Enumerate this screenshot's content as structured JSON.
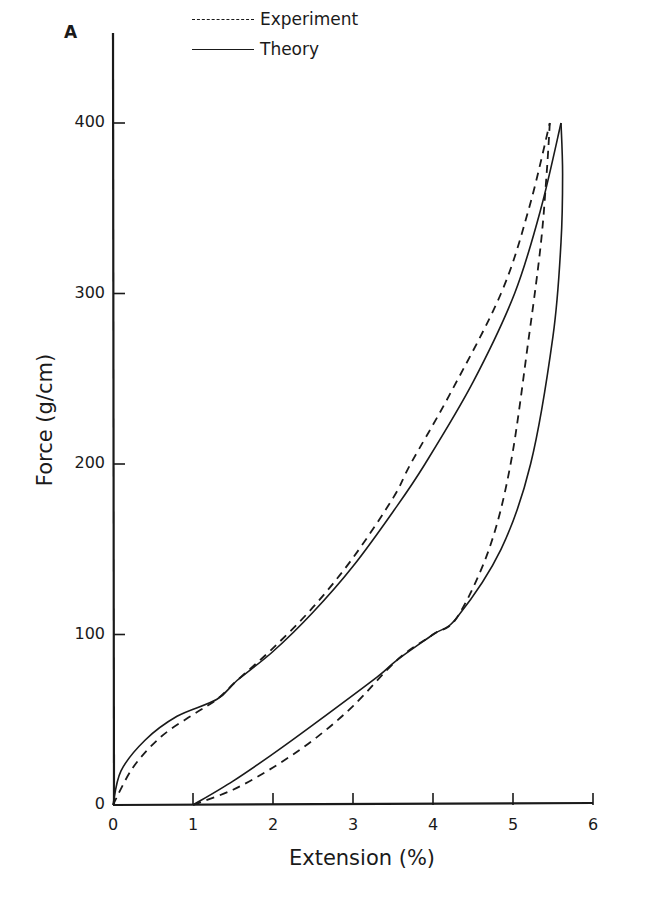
{
  "panel_label": "A",
  "legend": {
    "experiment": "Experiment",
    "theory": "Theory"
  },
  "axes": {
    "xlabel": "Extension (%)",
    "ylabel": "Force (g/cm)",
    "x_ticks": [
      "0",
      "1",
      "2",
      "3",
      "4",
      "5",
      "6"
    ],
    "y_ticks": [
      "0",
      "100",
      "200",
      "300",
      "400"
    ]
  },
  "chart_data": {
    "type": "line",
    "title": "",
    "panel": "A",
    "xlabel": "Extension (%)",
    "ylabel": "Force (g/cm)",
    "xlim": [
      0,
      6
    ],
    "ylim": [
      0,
      450
    ],
    "x_ticks": [
      0,
      1,
      2,
      3,
      4,
      5,
      6
    ],
    "y_ticks": [
      0,
      100,
      200,
      300,
      400
    ],
    "grid": false,
    "legend_position": "top-center",
    "series": [
      {
        "name": "Experiment (loading)",
        "style": "dashed",
        "x": [
          0,
          0.25,
          0.6,
          1.0,
          1.3,
          1.55,
          2.0,
          2.5,
          3.0,
          3.5,
          3.72,
          4.2,
          4.85,
          5.2,
          5.46
        ],
        "y": [
          0,
          22,
          40,
          53,
          62,
          73,
          92,
          116,
          145,
          180,
          200,
          240,
          300,
          350,
          400
        ]
      },
      {
        "name": "Experiment (unloading)",
        "style": "dashed",
        "x": [
          5.46,
          5.42,
          5.35,
          5.2,
          4.97,
          4.7,
          4.3,
          4.0,
          3.55,
          3.0,
          2.5,
          2.0,
          1.5,
          1.0
        ],
        "y": [
          400,
          370,
          330,
          275,
          200,
          150,
          110,
          100,
          85,
          58,
          38,
          22,
          9,
          0
        ]
      },
      {
        "name": "Theory (loading)",
        "style": "solid",
        "x": [
          0,
          0.1,
          0.4,
          0.8,
          1.3,
          1.55,
          2.0,
          2.5,
          3.0,
          3.5,
          3.9,
          4.5,
          5.02,
          5.35,
          5.6
        ],
        "y": [
          0,
          20,
          38,
          52,
          62,
          73,
          90,
          113,
          140,
          172,
          200,
          248,
          300,
          350,
          400
        ]
      },
      {
        "name": "Theory (unloading)",
        "style": "solid",
        "x": [
          5.6,
          5.62,
          5.6,
          5.5,
          5.22,
          4.85,
          4.3,
          4.0,
          3.55,
          3.3,
          2.5,
          2.0,
          1.5,
          1.0
        ],
        "y": [
          400,
          370,
          330,
          275,
          200,
          150,
          110,
          100,
          85,
          75,
          47,
          30,
          14,
          0
        ]
      }
    ],
    "legend": [
      {
        "label": "Experiment",
        "style": "dashed"
      },
      {
        "label": "Theory",
        "style": "solid"
      }
    ]
  }
}
